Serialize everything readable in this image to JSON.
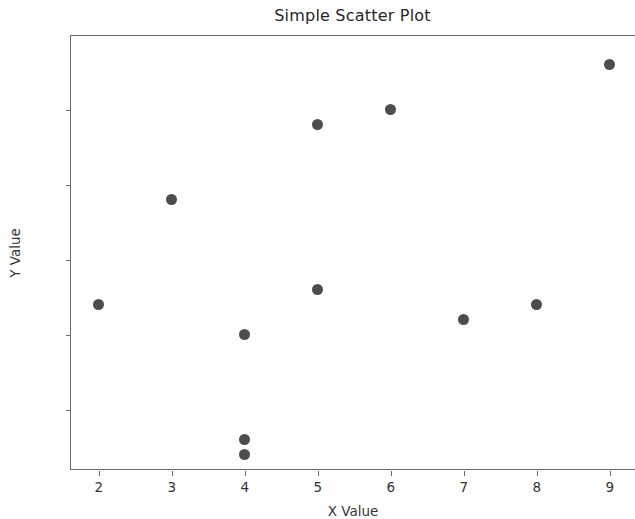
{
  "chart_data": {
    "type": "scatter",
    "title": "Simple Scatter Plot",
    "xlabel": "X Value",
    "ylabel": "Y Value",
    "x": [
      2,
      3,
      4,
      4,
      4,
      5,
      5,
      6,
      7,
      8,
      9
    ],
    "y": [
      87,
      94,
      85,
      78,
      77,
      99,
      88,
      100,
      86,
      87,
      103
    ],
    "points": [
      {
        "x": 2,
        "y": 87
      },
      {
        "x": 3,
        "y": 94
      },
      {
        "x": 4,
        "y": 85
      },
      {
        "x": 4,
        "y": 78
      },
      {
        "x": 4,
        "y": 77
      },
      {
        "x": 5,
        "y": 99
      },
      {
        "x": 5,
        "y": 88
      },
      {
        "x": 6,
        "y": 100
      },
      {
        "x": 7,
        "y": 86
      },
      {
        "x": 8,
        "y": 87
      },
      {
        "x": 9,
        "y": 103
      }
    ],
    "xticks": [
      2,
      3,
      4,
      5,
      6,
      7,
      8,
      9
    ],
    "yticks": [
      80,
      85,
      90,
      95,
      100
    ],
    "xtick_labels": [
      "2",
      "3",
      "4",
      "5",
      "6",
      "7",
      "8",
      "9"
    ],
    "ytick_labels": [
      "80",
      "85",
      "90",
      "95",
      "100"
    ],
    "xlim": [
      1.62,
      9.36
    ],
    "ylim": [
      75.9,
      104.9
    ],
    "grid": false,
    "legend": null,
    "marker_color": "#4d4d4d",
    "marker_size": 11,
    "axis_color": "#6b6b6b",
    "background_color": "#ffffff"
  }
}
